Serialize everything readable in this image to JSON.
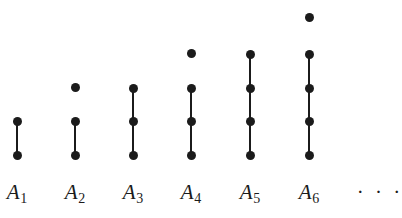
{
  "figure": {
    "background_color": "#ffffff",
    "node_color": "#1b1b1b",
    "edge_color": "#1b1b1b",
    "width": 402,
    "height": 218,
    "node_diameter": 9,
    "row_spacing": 33.5,
    "baseline_row_y": 155,
    "label_y": 182,
    "ellipsis": {
      "text": "· · ·",
      "x": 380,
      "y": 182
    },
    "columns": [
      {
        "label": "A",
        "subscript": "1",
        "full_label": "A1",
        "x": 17,
        "node_count": 2,
        "connected_count": 2,
        "isolated_count": 0,
        "node_y": [
          121,
          155
        ],
        "isolated_y": [],
        "edges": [
          [
            121,
            155
          ]
        ]
      },
      {
        "label": "A",
        "subscript": "2",
        "full_label": "A2",
        "x": 75,
        "node_count": 3,
        "connected_count": 2,
        "isolated_count": 1,
        "node_y": [
          87,
          121,
          155
        ],
        "isolated_y": [
          87
        ],
        "edges": [
          [
            121,
            155
          ]
        ]
      },
      {
        "label": "A",
        "subscript": "3",
        "full_label": "A3",
        "x": 133,
        "node_count": 3,
        "connected_count": 3,
        "isolated_count": 0,
        "node_y": [
          88,
          121,
          155
        ],
        "isolated_y": [],
        "edges": [
          [
            88,
            155
          ]
        ]
      },
      {
        "label": "A",
        "subscript": "4",
        "full_label": "A4",
        "x": 191,
        "node_count": 4,
        "connected_count": 3,
        "isolated_count": 1,
        "node_y": [
          53,
          88,
          121,
          155
        ],
        "isolated_y": [
          53
        ],
        "edges": [
          [
            88,
            155
          ]
        ]
      },
      {
        "label": "A",
        "subscript": "5",
        "full_label": "A5",
        "x": 250,
        "node_count": 4,
        "connected_count": 4,
        "isolated_count": 0,
        "node_y": [
          54,
          88,
          121,
          155
        ],
        "isolated_y": [],
        "edges": [
          [
            54,
            155
          ]
        ]
      },
      {
        "label": "A",
        "subscript": "6",
        "full_label": "A6",
        "x": 309,
        "node_count": 5,
        "connected_count": 4,
        "isolated_count": 1,
        "node_y": [
          17,
          54,
          88,
          121,
          155
        ],
        "isolated_y": [
          17
        ],
        "edges": [
          [
            54,
            155
          ]
        ]
      }
    ]
  }
}
